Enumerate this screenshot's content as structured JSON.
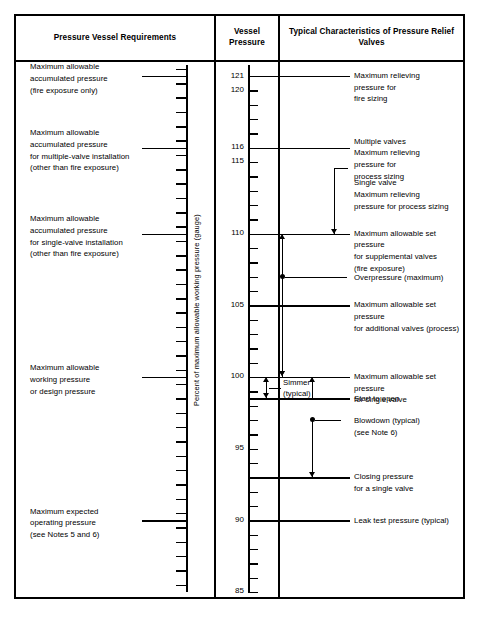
{
  "headers": {
    "left": "Pressure Vessel Requirements",
    "center": "Vessel\nPressure",
    "right": "Typical Characteristics of\nPressure Relief Valves"
  },
  "axis": {
    "title": "Percent of maximum allowable working pressure (gauge)",
    "min": 85,
    "max": 122,
    "tick_step": 1,
    "labeled_ticks": [
      121,
      120,
      116,
      115,
      110,
      105,
      100,
      95,
      90,
      85
    ]
  },
  "left_callouts": [
    {
      "value": 121,
      "text": "Maximum allowable\naccumulated pressure\n(fire exposure only)"
    },
    {
      "value": 116,
      "text": "Maximum allowable\naccumulated pressure\nfor multiple-valve installation\n(other than fire exposure)"
    },
    {
      "value": 110,
      "text": "Maximum allowable\naccumulated pressure\nfor single-valve installation\n(other than fire exposure)"
    },
    {
      "value": 100,
      "text": "Maximum allowable\nworking pressure\nor design pressure"
    },
    {
      "value": 90,
      "text": "Maximum expected\noperating pressure\n(see Notes 5 and 6)"
    }
  ],
  "right_callouts": [
    {
      "value": 121,
      "text": "Maximum relieving\npressure for\nfire sizing"
    },
    {
      "value": 116,
      "text": "Multiple valves\nMaximum relieving\npressure for\nprocess sizing"
    },
    {
      "value": 113.5,
      "text": "Single valve\nMaximum relieving\npressure for process sizing"
    },
    {
      "value": 110,
      "text": "Maximum allowable set pressure\nfor supplemental valves\n(fire exposure)"
    },
    {
      "value": 107,
      "text": "Overpressure (maximum)"
    },
    {
      "value": 105,
      "text": "Maximum allowable set pressure\nfor additional valves (process)"
    },
    {
      "value": 100,
      "text": "Maximum allowable set pressure\nfor single valve"
    },
    {
      "value": 98.5,
      "text": "Start to open"
    },
    {
      "value": 97,
      "text": "Blowdown (typical)\n(see Note 6)"
    },
    {
      "value": 93,
      "text": "Closing pressure\nfor a single valve"
    },
    {
      "value": 90,
      "text": "Leak test pressure (typical)"
    }
  ],
  "inline_labels": {
    "simmer": "Simmer\n(typical)"
  },
  "colors": {
    "ink": "#000000",
    "paper": "#ffffff"
  }
}
